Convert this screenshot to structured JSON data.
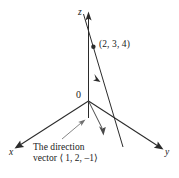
{
  "figure": {
    "background_color": "#ffffff",
    "ink_color": "#1a1a1a"
  },
  "axes": {
    "z_label": "z",
    "y_label": "y",
    "x_label": "x",
    "origin_label": "0"
  },
  "point": {
    "label": "(2, 3, 4)",
    "x": 2,
    "y": 3,
    "z": 4
  },
  "direction_vector": {
    "components": [
      1,
      2,
      -1
    ],
    "caption_line1": "The direction",
    "caption_line2": "vector ⟨ 1, 2, –1⟩"
  },
  "icons": {
    "z_axis_arrowhead": "arrowhead-up-icon",
    "y_axis_arrowhead": "arrowhead-down-right-icon",
    "x_axis_arrowhead": "arrowhead-down-left-icon",
    "line_arrowhead": "arrowhead-down-right-icon",
    "vector_arrowhead": "arrowhead-down-icon",
    "leader_arrowhead": "arrowhead-up-right-icon",
    "point_marker": "filled-dot-icon"
  }
}
